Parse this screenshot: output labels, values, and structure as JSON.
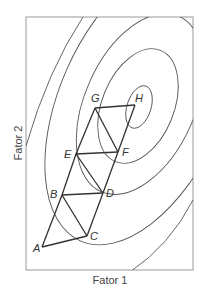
{
  "diagram": {
    "xlabel": "Fator 1",
    "ylabel": "Fator 2",
    "points": [
      {
        "label": "A",
        "x": 42,
        "y": 247
      },
      {
        "label": "B",
        "x": 62,
        "y": 195
      },
      {
        "label": "C",
        "x": 87,
        "y": 236
      },
      {
        "label": "D",
        "x": 103,
        "y": 193
      },
      {
        "label": "E",
        "x": 76,
        "y": 154
      },
      {
        "label": "F",
        "x": 118,
        "y": 152
      },
      {
        "label": "G",
        "x": 95,
        "y": 108
      },
      {
        "label": "H",
        "x": 135,
        "y": 105
      }
    ],
    "edges": [
      [
        "A",
        "B"
      ],
      [
        "A",
        "C"
      ],
      [
        "B",
        "C"
      ],
      [
        "B",
        "D"
      ],
      [
        "C",
        "D"
      ],
      [
        "B",
        "E"
      ],
      [
        "D",
        "E"
      ],
      [
        "D",
        "F"
      ],
      [
        "E",
        "F"
      ],
      [
        "E",
        "G"
      ],
      [
        "F",
        "G"
      ],
      [
        "F",
        "H"
      ],
      [
        "G",
        "H"
      ]
    ],
    "contour_count": 6,
    "colors": {
      "lines": "#333333",
      "contours": "#555555",
      "frame": "#888888"
    }
  }
}
